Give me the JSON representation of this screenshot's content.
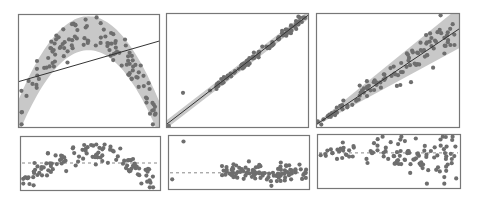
{
  "chart_data": [
    {
      "panel": "top-left",
      "type": "scatter",
      "title": "",
      "xlabel": "",
      "ylabel": "",
      "description": "Quadratic (inverted-U) data with misfit linear regression line; shaded band follows true parabola",
      "xlim": [
        0,
        1
      ],
      "ylim": [
        0,
        1
      ],
      "fit_line": {
        "x": [
          0,
          1
        ],
        "y": [
          0.4,
          0.76
        ]
      },
      "band": {
        "shape": "parabola",
        "center": [
          [
            0,
            0.08
          ],
          [
            0.25,
            0.62
          ],
          [
            0.5,
            0.82
          ],
          [
            0.75,
            0.62
          ],
          [
            1,
            0.1
          ]
        ],
        "half_width": 0.15
      },
      "points_count": 120
    },
    {
      "panel": "top-middle",
      "type": "scatter",
      "description": "Strong linear relationship with one outlier at low x, high y; narrow confidence band",
      "xlim": [
        0,
        1
      ],
      "ylim": [
        0,
        1
      ],
      "fit_line": {
        "x": [
          0,
          1
        ],
        "y": [
          0.02,
          0.98
        ]
      },
      "outlier": {
        "x": 0.12,
        "y": 0.3
      },
      "points_count": 100
    },
    {
      "panel": "top-right",
      "type": "scatter",
      "description": "Heteroscedastic linear data; variance grows with x; fan-shaped band",
      "xlim": [
        0,
        1
      ],
      "ylim": [
        0,
        1
      ],
      "fit_line": {
        "x": [
          0,
          1
        ],
        "y": [
          0.02,
          0.84
        ]
      },
      "band_half_width": {
        "x0": 0.01,
        "x1": 0.16
      },
      "points_count": 110
    },
    {
      "panel": "bottom-left",
      "type": "scatter",
      "description": "Residual plot showing arch pattern (nonlinearity)",
      "reference_line": {
        "style": "dashed",
        "y": 0.5
      }
    },
    {
      "panel": "bottom-middle",
      "type": "scatter",
      "description": "Residual plot with outlier at top-left; residuals clustered near zero line",
      "reference_line": {
        "style": "dashed",
        "y": 0.3
      }
    },
    {
      "panel": "bottom-right",
      "type": "scatter",
      "description": "Residual plot showing fan shape (heteroscedasticity)",
      "reference_line": {
        "style": "dashed",
        "y": 0.65
      }
    }
  ],
  "colors": {
    "point": "#6e6e6e",
    "band": "#c8c8c8",
    "line": "#333333",
    "frame": "#777777",
    "dash": "#888888"
  },
  "layout": {
    "top_panels": [
      {
        "x": 18,
        "y": 14,
        "w": 141,
        "h": 113
      },
      {
        "x": 166,
        "y": 13,
        "w": 142,
        "h": 114
      },
      {
        "x": 316,
        "y": 13,
        "w": 143,
        "h": 114
      }
    ],
    "bottom_panels": [
      {
        "x": 20,
        "y": 136,
        "w": 140,
        "h": 54
      },
      {
        "x": 168,
        "y": 135,
        "w": 141,
        "h": 54
      },
      {
        "x": 317,
        "y": 134,
        "w": 143,
        "h": 54
      }
    ]
  }
}
